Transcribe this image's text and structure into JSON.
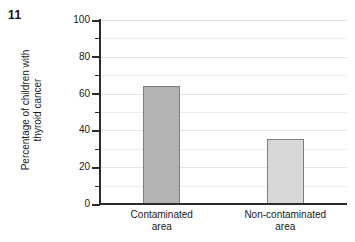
{
  "figure": {
    "number": "11"
  },
  "chart_data": {
    "type": "bar",
    "title": "",
    "xlabel": "",
    "ylabel": "Percentage of children with\nthyroid cancer",
    "categories": [
      "Contaminated\narea",
      "Non-contaminated\narea"
    ],
    "values": [
      64,
      35.5
    ],
    "series": [
      {
        "name": "Percentage of children with thyroid cancer",
        "values": [
          64,
          35.5
        ]
      }
    ],
    "ylim": [
      0,
      100
    ],
    "y_major_ticks": [
      0,
      20,
      40,
      60,
      80,
      100
    ],
    "y_tick_labels": [
      "0",
      "20",
      "40",
      "60",
      "80",
      "100"
    ],
    "y_minor_ticks": [
      10,
      30,
      50,
      70,
      90
    ],
    "grid": true,
    "grid_axis": "y",
    "legend": false,
    "bar_colors": [
      "#b3b3b3",
      "#d8d8d8"
    ],
    "bar_border_color": "#7d7d7d",
    "axis_color": "#2b2b2b",
    "grid_color": "#ededed"
  }
}
